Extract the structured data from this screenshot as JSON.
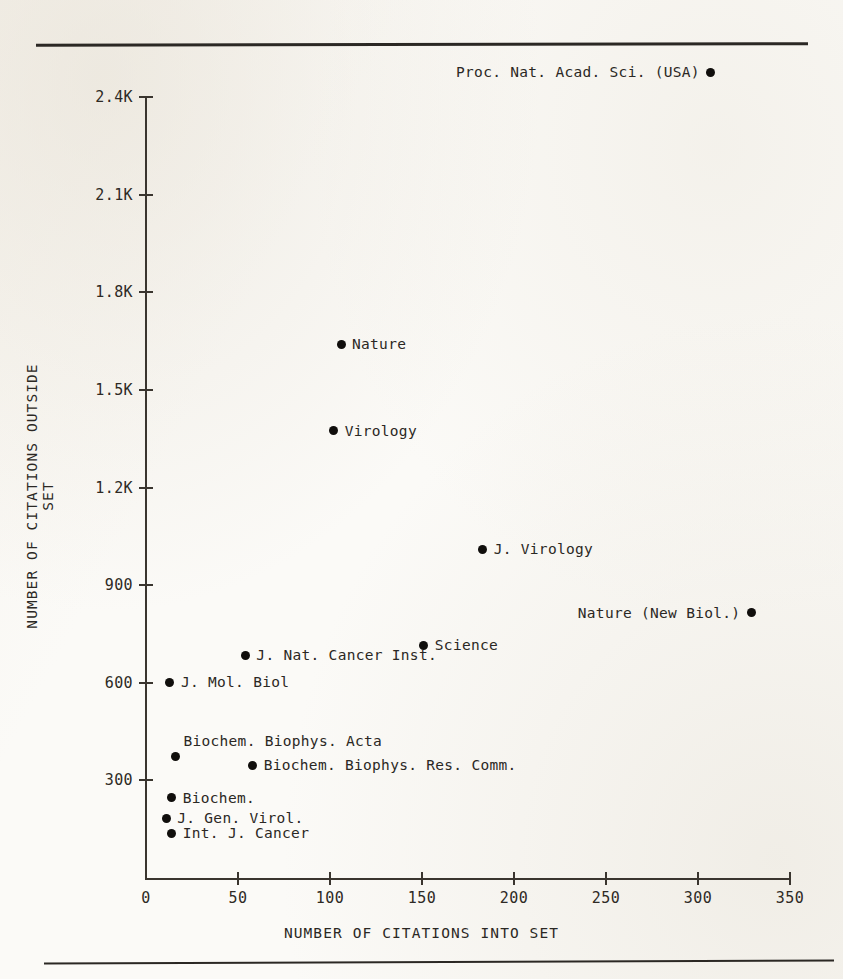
{
  "figure": {
    "background_color": "#fbfaf7",
    "ink_color": "#2b2824",
    "top_rule": "horizontal-rule",
    "bottom_rule": "horizontal-rule"
  },
  "chart_data": {
    "type": "scatter",
    "title": "",
    "xlabel": "NUMBER OF CITATIONS INTO SET",
    "ylabel": "NUMBER OF CITATIONS OUTSIDE SET",
    "xlim": [
      0,
      350
    ],
    "ylim": [
      0,
      2400
    ],
    "xticks": [
      0,
      50,
      100,
      150,
      200,
      250,
      300,
      350
    ],
    "xticklabels": [
      "0",
      "50",
      "100",
      "150",
      "200",
      "250",
      "300",
      "350"
    ],
    "yticks": [
      300,
      600,
      900,
      1200,
      1500,
      1800,
      2100,
      2400
    ],
    "yticklabels": [
      "300",
      "600",
      "900",
      "1.2K",
      "1.5K",
      "1.8K",
      "2.1K",
      "2.4K"
    ],
    "grid": false,
    "legend": "none",
    "marker": "filled-circle",
    "marker_color": "#100e0c",
    "points": [
      {
        "label": "Proc. Nat. Acad. Sci. (USA)",
        "x": 307,
        "y": 2475,
        "label_side": "left",
        "off_scale": true
      },
      {
        "label": "Nature",
        "x": 106,
        "y": 1640,
        "label_side": "right",
        "off_scale": false
      },
      {
        "label": "Virology",
        "x": 102,
        "y": 1375,
        "label_side": "right",
        "off_scale": false
      },
      {
        "label": "J. Virology",
        "x": 183,
        "y": 1010,
        "label_side": "right",
        "off_scale": false
      },
      {
        "label": "Nature (New Biol.)",
        "x": 329,
        "y": 815,
        "label_side": "left",
        "off_scale": false
      },
      {
        "label": "Science",
        "x": 151,
        "y": 715,
        "label_side": "right",
        "off_scale": false
      },
      {
        "label": "J. Nat. Cancer Inst.",
        "x": 54,
        "y": 685,
        "label_side": "right",
        "off_scale": false
      },
      {
        "label": "J. Mol. Biol",
        "x": 13,
        "y": 602,
        "label_side": "right",
        "off_scale": false
      },
      {
        "label": "Biochem. Biophys. Acta",
        "x": 16,
        "y": 372,
        "label_side": "above",
        "off_scale": false
      },
      {
        "label": "Biochem. Biophys. Res. Comm.",
        "x": 58,
        "y": 347,
        "label_side": "right",
        "off_scale": false
      },
      {
        "label": "Biochem.",
        "x": 14,
        "y": 246,
        "label_side": "right",
        "off_scale": false
      },
      {
        "label": "J. Gen. Virol.",
        "x": 11,
        "y": 184,
        "label_side": "right",
        "off_scale": false
      },
      {
        "label": "Int. J. Cancer",
        "x": 14,
        "y": 138,
        "label_side": "right",
        "off_scale": false
      }
    ]
  }
}
